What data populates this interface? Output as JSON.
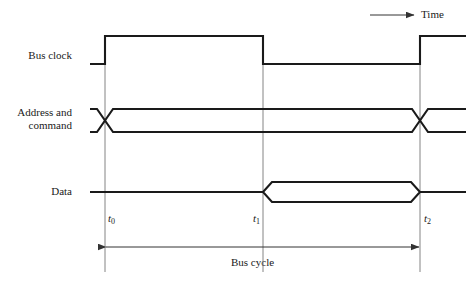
{
  "figure": {
    "kind": "bus-timing-diagram",
    "background_color": "#ffffff",
    "line_color": "#1a1a1a",
    "guide_color": "#6b6b6b",
    "width": 468,
    "height": 284
  },
  "time_axis": {
    "label": "Time",
    "arrow_from_x": 370,
    "arrow_to_x": 414,
    "arrow_y": 15,
    "direction": "right"
  },
  "signals": [
    {
      "name": "bus-clock",
      "label": "Bus clock",
      "label_lines": [
        "Bus clock"
      ],
      "type": "clock",
      "low_y": 64,
      "high_y": 36,
      "start_x": 90,
      "end_x": 466,
      "edges": [
        {
          "at": "t0",
          "x": 105,
          "kind": "rising"
        },
        {
          "at": "t1",
          "x": 263,
          "kind": "falling"
        },
        {
          "at": "t2",
          "x": 420,
          "kind": "rising"
        }
      ]
    },
    {
      "name": "address-and-command",
      "label": "Address and command",
      "label_lines": [
        "Address and",
        "command"
      ],
      "type": "bus-pair",
      "top_y": 109,
      "bottom_y": 132,
      "start_x": 90,
      "end_x": 466,
      "crossings": [
        {
          "at": "t0",
          "x": 105,
          "half_width": 8
        },
        {
          "at": "t2",
          "x": 420,
          "half_width": 8
        }
      ]
    },
    {
      "name": "data",
      "label": "Data",
      "label_lines": [
        "Data"
      ],
      "type": "valid-window",
      "idle_y": 192,
      "top_y": 182,
      "bottom_y": 202,
      "start_x": 90,
      "end_x": 466,
      "window": {
        "from": "t1",
        "from_x": 263,
        "to": "t2",
        "to_x": 420,
        "bevel": 9
      }
    }
  ],
  "time_markers": [
    {
      "name": "t0",
      "text": "t",
      "sub": "0",
      "x": 105,
      "label_x": 108,
      "label_y": 218,
      "guide_top": 36,
      "guide_bottom": 272
    },
    {
      "name": "t1",
      "text": "t",
      "sub": "1",
      "x": 263,
      "label_x": 255,
      "label_y": 218,
      "guide_top": 64,
      "guide_bottom": 272
    },
    {
      "name": "t2",
      "text": "t",
      "sub": "2",
      "x": 420,
      "label_x": 424,
      "label_y": 218,
      "guide_top": 36,
      "guide_bottom": 272
    }
  ],
  "span_annotation": {
    "name": "bus-cycle",
    "label": "Bus cycle",
    "from_x": 105,
    "to_x": 420,
    "arrow_y": 247,
    "label_x": 262,
    "label_y": 258,
    "double_headed": true
  }
}
